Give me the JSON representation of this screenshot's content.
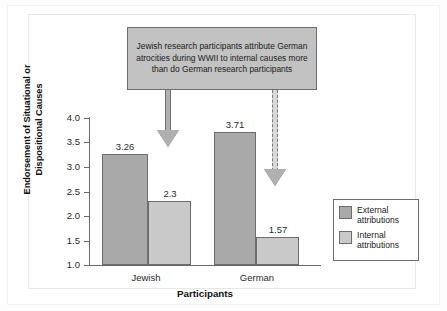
{
  "figure": {
    "callout_text": "Jewish research participants attribute German atrocities during WWII to internal causes more than do German research participants"
  },
  "legend": {
    "items": [
      {
        "label": "External\nattributions",
        "color": "#a9a9a9",
        "key": "external"
      },
      {
        "label": "Internal\nattributions",
        "color": "#c9c9c9",
        "key": "internal"
      }
    ]
  },
  "chart_data": {
    "type": "bar",
    "title": "",
    "xlabel": "Participants",
    "ylabel": "Endorsement of Situational or Dispositional Causes",
    "categories": [
      "Jewish",
      "German"
    ],
    "series": [
      {
        "name": "External attributions",
        "values": [
          3.26,
          3.71
        ],
        "color": "#a9a9a9"
      },
      {
        "name": "Internal attributions",
        "values": [
          2.3,
          1.57
        ],
        "color": "#c9c9c9"
      }
    ],
    "value_labels": [
      "3.26",
      "2.3",
      "3.71",
      "1.57"
    ],
    "ylim": [
      1.0,
      4.0
    ],
    "ytick_labels": [
      "4.0",
      "3.5",
      "3.0",
      "2.5",
      "2.0",
      "1.5",
      "1.0"
    ],
    "ytick_values": [
      4.0,
      3.5,
      3.0,
      2.5,
      2.0,
      1.5,
      1.0
    ],
    "grid": false,
    "legend_position": "right",
    "annotations": [
      {
        "text": "Jewish research participants attribute German atrocities during WWII to internal causes more than do German research participants",
        "arrows": [
          {
            "style": "solid",
            "points_to": "Jewish internal attributions bar (2.3)"
          },
          {
            "style": "dashed",
            "points_to": "German internal attributions bar (1.57)"
          }
        ]
      }
    ]
  }
}
